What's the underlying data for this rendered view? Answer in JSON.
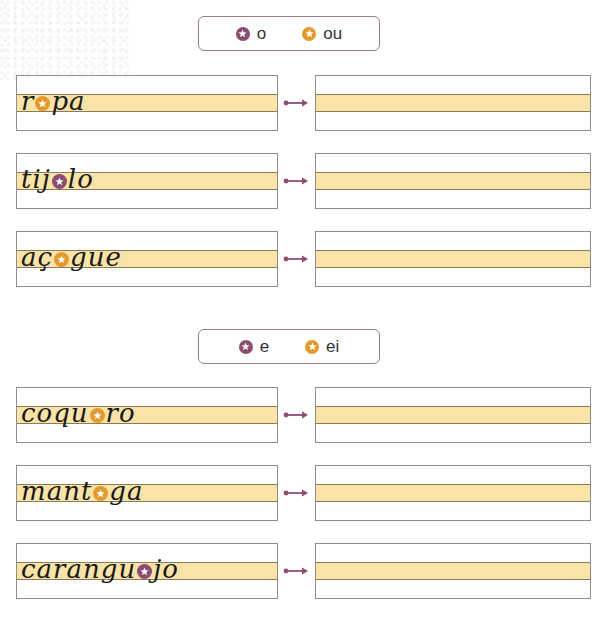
{
  "sections": [
    {
      "legend": {
        "options": [
          {
            "label": "o",
            "color": "purple",
            "icon": "star-badge-icon"
          },
          {
            "label": "ou",
            "color": "orange",
            "icon": "star-badge-icon"
          }
        ]
      },
      "rows": [
        {
          "before": "r",
          "badge": "orange",
          "after": "pa",
          "answer": ""
        },
        {
          "before": "tij",
          "badge": "purple",
          "after": "lo",
          "answer": ""
        },
        {
          "before": "aç",
          "badge": "orange",
          "after": "gue",
          "answer": ""
        }
      ]
    },
    {
      "legend": {
        "options": [
          {
            "label": "e",
            "color": "purple",
            "icon": "star-badge-icon"
          },
          {
            "label": "ei",
            "color": "orange",
            "icon": "star-badge-icon"
          }
        ]
      },
      "rows": [
        {
          "before": "coqu",
          "badge": "orange",
          "after": "ro",
          "answer": ""
        },
        {
          "before": "mant",
          "badge": "orange",
          "after": "ga",
          "answer": ""
        },
        {
          "before": "carangu",
          "badge": "purple",
          "after": "jo",
          "answer": ""
        }
      ]
    }
  ],
  "colors": {
    "purple": "#8c4d72",
    "orange": "#e29a2e",
    "band": "#f9e3a7",
    "box_border": "#8e8e8e",
    "legend_border": "#a07a8e",
    "arrow": "#8c4d72"
  }
}
